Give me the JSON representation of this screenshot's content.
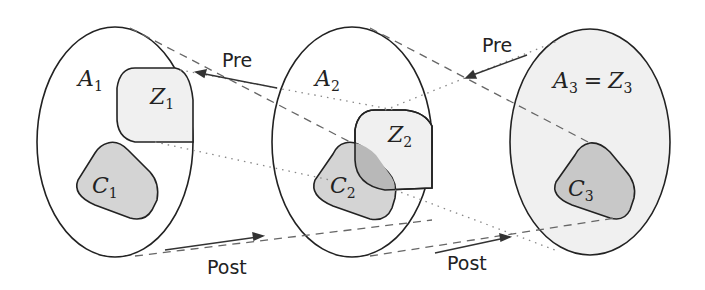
{
  "diagram": {
    "colors": {
      "outline": "#222222",
      "light_fill": "#f0f0f0",
      "dark_fill": "#d4d4d4",
      "overlap_fill": "#b8b8b8",
      "dash": "#666666",
      "dot": "#888888",
      "background": "#ffffff"
    },
    "sets": [
      {
        "name": "A",
        "sub": "1",
        "z": {
          "name": "Z",
          "sub": "1"
        },
        "c": {
          "name": "C",
          "sub": "1"
        }
      },
      {
        "name": "A",
        "sub": "2",
        "z": {
          "name": "Z",
          "sub": "2"
        },
        "c": {
          "name": "C",
          "sub": "2"
        }
      },
      {
        "name": "A",
        "sub": "3",
        "eq": "=",
        "z": {
          "name": "Z",
          "sub": "3"
        },
        "c": {
          "name": "C",
          "sub": "3"
        }
      }
    ],
    "arrows": {
      "pre_1": "Pre",
      "pre_2": "Pre",
      "post_1": "Post",
      "post_2": "Post"
    }
  }
}
